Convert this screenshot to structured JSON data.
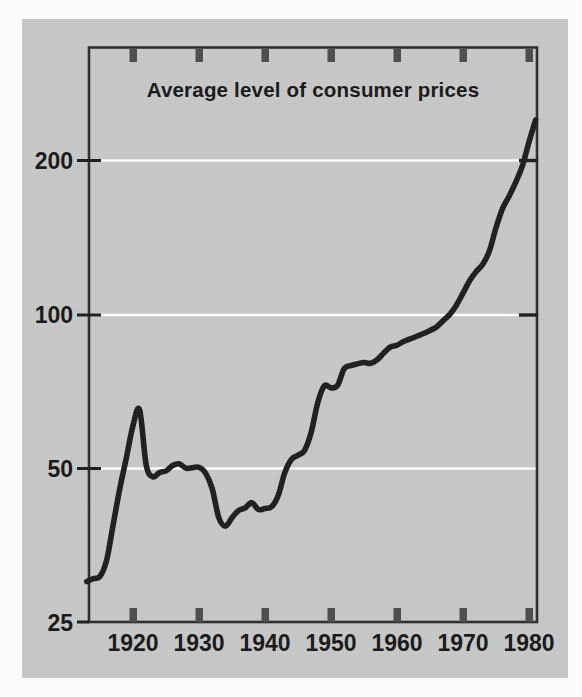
{
  "figure": {
    "background_color": "#ffffff",
    "panel_color": "#c9c9c9",
    "ink_color": "#1a1a1a",
    "gridline_color": "#ffffff"
  },
  "chart_data": {
    "type": "line",
    "title": "Average level of consumer prices",
    "xlabel": "",
    "ylabel": "",
    "yscale": "log",
    "ylim": [
      25,
      260
    ],
    "xlim": [
      1913,
      1981
    ],
    "grid": "horizontal-white-lines-at-y-ticks",
    "legend": "none",
    "y_ticks": [
      "25",
      "50",
      "100",
      "200"
    ],
    "y_tick_values": [
      25,
      50,
      100,
      200
    ],
    "x_ticks": [
      "1920",
      "1930",
      "1940",
      "1950",
      "1960",
      "1970",
      "1980"
    ],
    "x_tick_values": [
      1920,
      1930,
      1940,
      1950,
      1960,
      1970,
      1980
    ],
    "series": [
      {
        "name": "Average level of consumer prices",
        "x": [
          1913,
          1914,
          1915,
          1916,
          1917,
          1918,
          1919,
          1920,
          1921,
          1922,
          1923,
          1924,
          1925,
          1926,
          1927,
          1928,
          1929,
          1930,
          1931,
          1932,
          1933,
          1934,
          1935,
          1936,
          1937,
          1938,
          1939,
          1940,
          1941,
          1942,
          1943,
          1944,
          1945,
          1946,
          1947,
          1948,
          1949,
          1950,
          1951,
          1952,
          1953,
          1954,
          1955,
          1956,
          1957,
          1958,
          1959,
          1960,
          1961,
          1962,
          1963,
          1964,
          1965,
          1966,
          1967,
          1968,
          1969,
          1970,
          1971,
          1972,
          1973,
          1974,
          1975,
          1976,
          1977,
          1978,
          1979,
          1980,
          1981
        ],
        "y": [
          30.0,
          30.4,
          30.7,
          33.0,
          38.8,
          45.6,
          52.4,
          60.6,
          65.0,
          50.7,
          48.1,
          49.0,
          49.4,
          50.6,
          51.0,
          50.0,
          50.1,
          50.2,
          48.9,
          45.6,
          40.0,
          38.5,
          40.0,
          41.3,
          41.8,
          42.8,
          41.5,
          41.7,
          42.0,
          44.2,
          49.0,
          52.0,
          53.0,
          54.2,
          58.8,
          67.2,
          72.5,
          71.8,
          72.6,
          78.3,
          79.4,
          80.0,
          80.5,
          80.2,
          81.5,
          84.0,
          86.3,
          87.0,
          88.5,
          89.5,
          90.6,
          91.7,
          93.0,
          94.5,
          97.2,
          100.0,
          104.2,
          110.0,
          116.3,
          121.3,
          125.3,
          133.1,
          147.7,
          161.2,
          170.5,
          181.5,
          195.3,
          217.4,
          240.0
        ]
      }
    ],
    "annotations": [
      {
        "text": "Peak near 1920 at about 65",
        "x": 1920,
        "y": 65
      },
      {
        "text": "Trough near 1933-1934 at about 38.5",
        "x": 1934,
        "y": 38.5
      },
      {
        "text": "Crosses index 100 about 1968",
        "x": 1968,
        "y": 100
      },
      {
        "text": "Ends about 240 in 1981",
        "x": 1981,
        "y": 240
      }
    ]
  }
}
